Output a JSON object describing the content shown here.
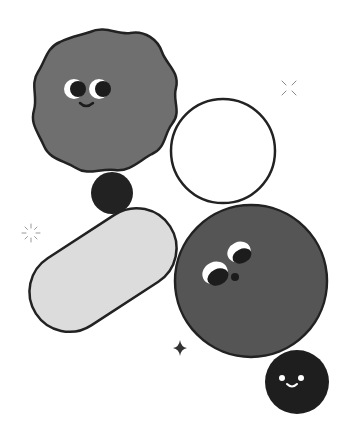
{
  "illustration": {
    "title": "Abstract character shapes",
    "colors": {
      "background": "#ffffff",
      "outline": "#222222",
      "wavy_blob": "#6f6f6f",
      "dark_ball": "#222222",
      "white_circle": "#ffffff",
      "pill": "#dcdcdc",
      "big_circle": "#555555",
      "small_face": "#1e1e1e",
      "eye_white": "#ffffff",
      "eye_dark": "#1c1c1c",
      "sparkle": "#333333",
      "burst": "#999999"
    },
    "shapes": [
      {
        "name": "wavy-blob-character",
        "face": "smiling, eyes looking right"
      },
      {
        "name": "dark-ball"
      },
      {
        "name": "white-circle"
      },
      {
        "name": "pill-capsule"
      },
      {
        "name": "big-circle-character",
        "face": "eyes looking up-left, small nose"
      },
      {
        "name": "small-face-character",
        "face": "smiling dot eyes"
      }
    ],
    "decorations": [
      {
        "name": "burst-icon-left"
      },
      {
        "name": "burst-icon-right"
      },
      {
        "name": "sparkle-icon"
      }
    ]
  }
}
